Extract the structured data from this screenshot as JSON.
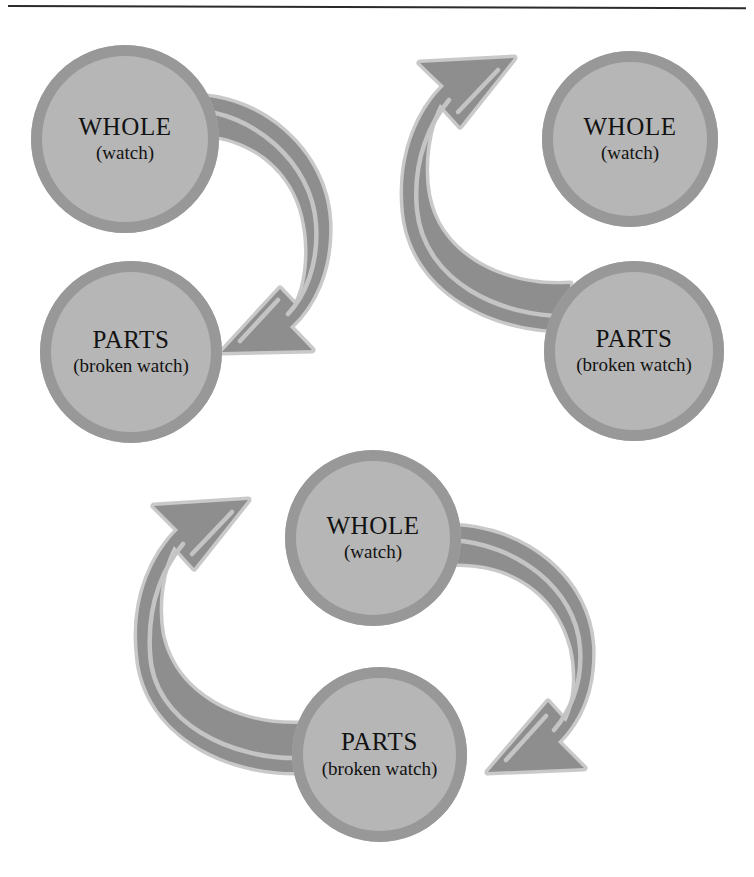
{
  "figure": {
    "background_color": "#ffffff",
    "node_fill_color": "#b6b6b6",
    "node_ring_color": "#989898",
    "arrow_fill_color": "#8e8e8e",
    "arrow_outline_color": "#c9c9c9",
    "rule_color": "#2b2b2b"
  },
  "labels": {
    "whole_title": "WHOLE",
    "whole_subtitle": "(watch)",
    "parts_title": "PARTS",
    "parts_subtitle": "(broken watch)"
  },
  "panels": [
    {
      "id": "top-left",
      "name": "whole-to-parts",
      "direction": "WHOLE to PARTS",
      "arrows": 1,
      "nodes": [
        {
          "role": "whole",
          "title": "WHOLE",
          "subtitle": "(watch)",
          "position": "top-left"
        },
        {
          "role": "parts",
          "title": "PARTS",
          "subtitle": "(broken watch)",
          "position": "bottom-left"
        }
      ]
    },
    {
      "id": "top-right",
      "name": "parts-to-whole",
      "direction": "PARTS to WHOLE",
      "arrows": 1,
      "nodes": [
        {
          "role": "whole",
          "title": "WHOLE",
          "subtitle": "(watch)",
          "position": "top-right"
        },
        {
          "role": "parts",
          "title": "PARTS",
          "subtitle": "(broken watch)",
          "position": "bottom-right"
        }
      ]
    },
    {
      "id": "bottom-center",
      "name": "whole-parts-cycle",
      "direction": "WHOLE to PARTS and PARTS to WHOLE",
      "arrows": 2,
      "nodes": [
        {
          "role": "whole",
          "title": "WHOLE",
          "subtitle": "(watch)",
          "position": "top-center"
        },
        {
          "role": "parts",
          "title": "PARTS",
          "subtitle": "(broken watch)",
          "position": "bottom-center"
        }
      ]
    }
  ]
}
